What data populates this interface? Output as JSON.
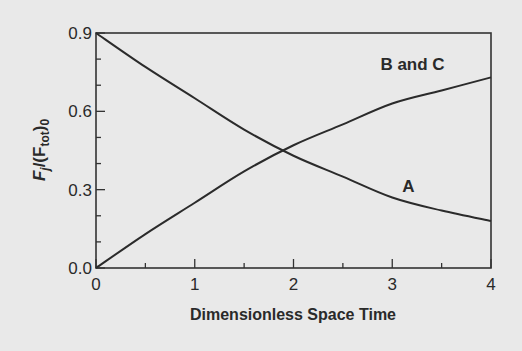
{
  "chart_data": {
    "type": "line",
    "title": "",
    "xlabel": "Dimensionless Space Time",
    "ylabel": {
      "main": "F",
      "sub1": "j",
      "mid": "/(F",
      "sub2": "tot",
      "end": ")",
      "sub3": "0"
    },
    "xlim": [
      0,
      4
    ],
    "ylim": [
      0,
      0.9
    ],
    "x_ticks": [
      0,
      1,
      2,
      3,
      4
    ],
    "x_tick_labels": [
      "0",
      "1",
      "2",
      "3",
      "4"
    ],
    "x_minor_step": 0.5,
    "y_ticks": [
      0,
      0.3,
      0.6,
      0.9
    ],
    "y_tick_labels": [
      "0.0",
      "0.3",
      "0.6",
      "0.9"
    ],
    "y_minor_step": 0.1,
    "grid": false,
    "x": [
      0,
      0.5,
      1,
      1.5,
      2,
      2.5,
      3,
      3.5,
      4
    ],
    "series": [
      {
        "name": "A",
        "values": [
          0.9,
          0.77,
          0.65,
          0.53,
          0.43,
          0.35,
          0.27,
          0.22,
          0.18
        ],
        "label_at": [
          3.1,
          0.29
        ]
      },
      {
        "name": "B and C",
        "values": [
          0.0,
          0.13,
          0.25,
          0.37,
          0.47,
          0.55,
          0.63,
          0.68,
          0.73
        ],
        "label_at": [
          2.88,
          0.76
        ]
      }
    ]
  }
}
